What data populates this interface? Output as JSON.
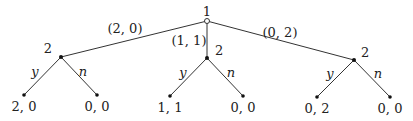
{
  "diagram": {
    "type": "game-tree",
    "root": {
      "player": "1",
      "x": 207,
      "y": 21
    },
    "branches": [
      {
        "action": "(2, 0)",
        "label_pos": [
          125,
          33
        ],
        "node": {
          "player": "2",
          "x": 61,
          "y": 57,
          "label_pos": [
            52,
            53
          ]
        },
        "children": [
          {
            "action": "y",
            "payoff": "2, 0",
            "x": 24,
            "y": 95,
            "action_pos": [
              35,
              76
            ],
            "payoff_pos": [
              24,
              111
            ]
          },
          {
            "action": "n",
            "payoff": "0, 0",
            "x": 97,
            "y": 95,
            "action_pos": [
              83,
              76
            ],
            "payoff_pos": [
              97,
              111
            ]
          }
        ]
      },
      {
        "action": "(1, 1)",
        "label_pos": [
          189,
          45
        ],
        "node": {
          "player": "2",
          "x": 207,
          "y": 58,
          "label_pos": [
            215,
            55
          ]
        },
        "children": [
          {
            "action": "y",
            "payoff": "1, 1",
            "x": 170,
            "y": 96,
            "action_pos": [
              183,
              77
            ],
            "payoff_pos": [
              170,
              112
            ]
          },
          {
            "action": "n",
            "payoff": "0, 0",
            "x": 243,
            "y": 96,
            "action_pos": [
              231,
              77
            ],
            "payoff_pos": [
              243,
              112
            ]
          }
        ]
      },
      {
        "action": "(0, 2)",
        "label_pos": [
          280,
          37
        ],
        "node": {
          "player": "2",
          "x": 354,
          "y": 60,
          "label_pos": [
            361,
            57
          ]
        },
        "children": [
          {
            "action": "y",
            "payoff": "0, 2",
            "x": 317,
            "y": 97,
            "action_pos": [
              330,
              78
            ],
            "payoff_pos": [
              317,
              113
            ]
          },
          {
            "action": "n",
            "payoff": "0, 0",
            "x": 390,
            "y": 97,
            "action_pos": [
              378,
              78
            ],
            "payoff_pos": [
              390,
              113
            ]
          }
        ]
      }
    ]
  }
}
